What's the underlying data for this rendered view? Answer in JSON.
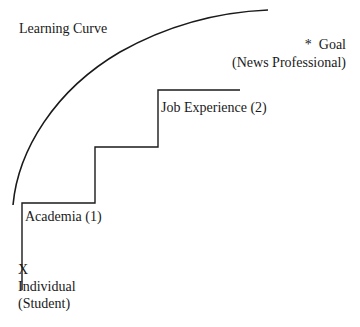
{
  "diagram": {
    "curve_label": "Learning Curve",
    "goal": {
      "marker": "*",
      "label": "Goal",
      "sublabel": "(News Professional)"
    },
    "steps": [
      {
        "label": "Academia (1)"
      },
      {
        "label": "Job Experience (2)"
      }
    ],
    "start": {
      "marker": "X",
      "label": "Individual",
      "sublabel": "(Student)"
    },
    "colors": {
      "line": "#1a1a1a",
      "background": "#ffffff"
    }
  }
}
